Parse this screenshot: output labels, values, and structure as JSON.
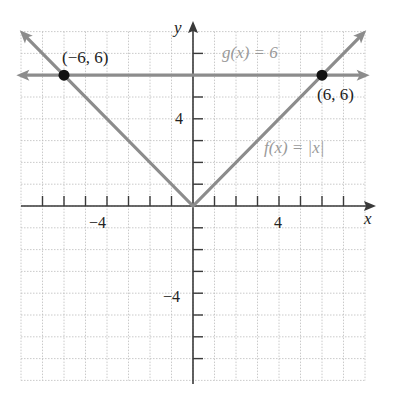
{
  "chart_data": {
    "type": "line",
    "title": "",
    "xlabel": "x",
    "ylabel": "y",
    "xlim": [
      -8,
      8
    ],
    "ylim": [
      -8,
      8
    ],
    "grid": true,
    "x_tick_labels": [
      {
        "value": -4,
        "label": "−4"
      },
      {
        "value": 4,
        "label": "4"
      }
    ],
    "y_tick_labels": [
      {
        "value": 4,
        "label": "4"
      },
      {
        "value": -4,
        "label": "−4"
      }
    ],
    "series": [
      {
        "name": "f(x) = |x|",
        "kind": "absolute-value",
        "points": [
          [
            -7.9,
            7.9
          ],
          [
            0,
            0
          ],
          [
            7.9,
            7.9
          ]
        ],
        "color": "#8c8c8c"
      },
      {
        "name": "g(x) = 6",
        "kind": "horizontal",
        "points": [
          [
            -7.9,
            6
          ],
          [
            7.9,
            6
          ]
        ],
        "color": "#8c8c8c"
      }
    ],
    "annotations": [
      {
        "label": "(−6, 6)",
        "x": -6,
        "y": 6
      },
      {
        "label": "(6, 6)",
        "x": 6,
        "y": 6
      },
      {
        "label": "g(x) = 6",
        "x": 3.6,
        "y": 7.1
      },
      {
        "label": "f(x) = |x|",
        "x": 5.9,
        "y": 2.4
      }
    ],
    "intersection_points": [
      [
        -6,
        6
      ],
      [
        6,
        6
      ]
    ]
  },
  "labels": {
    "x_axis": "x",
    "y_axis": "y",
    "x_tick_neg4": "−4",
    "x_tick_4": "4",
    "y_tick_4": "4",
    "y_tick_neg4": "−4",
    "point_left": "(−6, 6)",
    "point_right": "(6, 6)",
    "g_label": "g(x) = 6",
    "f_label": "f(x) = |x|"
  },
  "colors": {
    "axis": "#3a3a3a",
    "curve": "#8c8c8c",
    "grid": "#bdbdbd",
    "point": "#111111",
    "function_label": "#9a9a9a"
  }
}
